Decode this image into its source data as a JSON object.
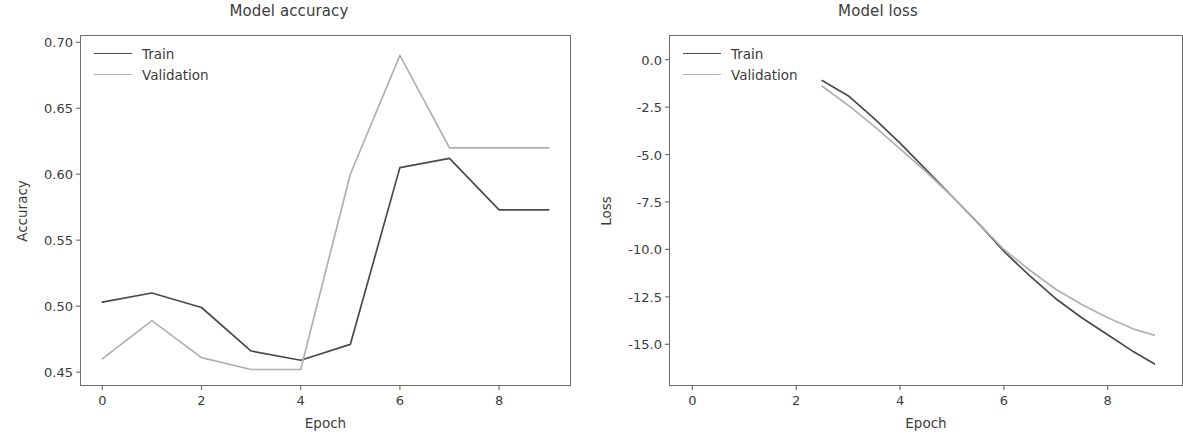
{
  "figure": {
    "width": 1155,
    "height": 435,
    "background": "#ffffff"
  },
  "colors": {
    "train": "#4a4a4a",
    "validation": "#b0b0b0",
    "axis": "#6e6e6e",
    "text": "#3c3c3c"
  },
  "panels": [
    {
      "id": "accuracy",
      "title": "Model accuracy",
      "xlabel": "Epoch",
      "ylabel": "Accuracy",
      "yticks": [
        "0.45",
        "0.50",
        "0.55",
        "0.60",
        "0.65",
        "0.70"
      ],
      "xticks": [
        "0",
        "2",
        "4",
        "6",
        "8"
      ],
      "legend": [
        {
          "label": "Train",
          "color": "#4a4a4a"
        },
        {
          "label": "Validation",
          "color": "#b0b0b0"
        }
      ]
    },
    {
      "id": "loss",
      "title": "Model loss",
      "xlabel": "Epoch",
      "ylabel": "Loss",
      "yticks": [
        "-15.0",
        "-12.5",
        "-10.0",
        "-7.5",
        "-5.0",
        "-2.5",
        "0.0"
      ],
      "xticks": [
        "0",
        "2",
        "4",
        "6",
        "8"
      ],
      "legend": [
        {
          "label": "Train",
          "color": "#4a4a4a"
        },
        {
          "label": "Validation",
          "color": "#b0b0b0"
        }
      ]
    }
  ],
  "chart_data": [
    {
      "type": "line",
      "title": "Model accuracy",
      "xlabel": "Epoch",
      "ylabel": "Accuracy",
      "x": [
        0,
        1,
        2,
        3,
        4,
        5,
        6,
        7,
        8,
        9
      ],
      "xlim": [
        -0.45,
        9.45
      ],
      "ylim": [
        0.4395,
        0.7055
      ],
      "xticks": [
        0,
        2,
        4,
        6,
        8
      ],
      "yticks": [
        0.45,
        0.5,
        0.55,
        0.6,
        0.65,
        0.7
      ],
      "grid": false,
      "legend_position": "upper left",
      "series": [
        {
          "name": "Train",
          "color": "#4a4a4a",
          "values": [
            0.503,
            0.51,
            0.499,
            0.466,
            0.459,
            0.471,
            0.605,
            0.612,
            0.573,
            0.573
          ]
        },
        {
          "name": "Validation",
          "color": "#b0b0b0",
          "values": [
            0.46,
            0.489,
            0.461,
            0.452,
            0.452,
            0.6,
            0.69,
            0.62,
            0.62,
            0.62
          ]
        }
      ]
    },
    {
      "type": "line",
      "title": "Model loss",
      "xlabel": "Epoch",
      "ylabel": "Loss",
      "x": [
        2.5,
        3.0,
        3.5,
        4.0,
        4.5,
        5.0,
        5.5,
        6.0,
        6.5,
        7.0,
        7.5,
        8.0,
        8.5,
        9.0
      ],
      "xlim": [
        -0.45,
        9.45
      ],
      "ylim": [
        -17.2,
        1.3
      ],
      "xticks": [
        0,
        2,
        4,
        6,
        8
      ],
      "yticks": [
        -15.0,
        -12.5,
        -10.0,
        -7.5,
        -5.0,
        -2.5,
        0.0
      ],
      "grid": false,
      "legend_position": "upper left",
      "series": [
        {
          "name": "Train",
          "color": "#4a4a4a",
          "values": [
            -1.1,
            -1.9,
            -3.1,
            -4.4,
            -5.8,
            -7.2,
            -8.6,
            -10.1,
            -11.4,
            -12.6,
            -13.6,
            -14.5,
            -15.4,
            -16.2
          ]
        },
        {
          "name": "Validation",
          "color": "#b0b0b0",
          "values": [
            -1.4,
            -2.4,
            -3.5,
            -4.7,
            -5.9,
            -7.2,
            -8.6,
            -10.0,
            -11.1,
            -12.1,
            -12.9,
            -13.6,
            -14.2,
            -14.6
          ]
        }
      ]
    }
  ]
}
